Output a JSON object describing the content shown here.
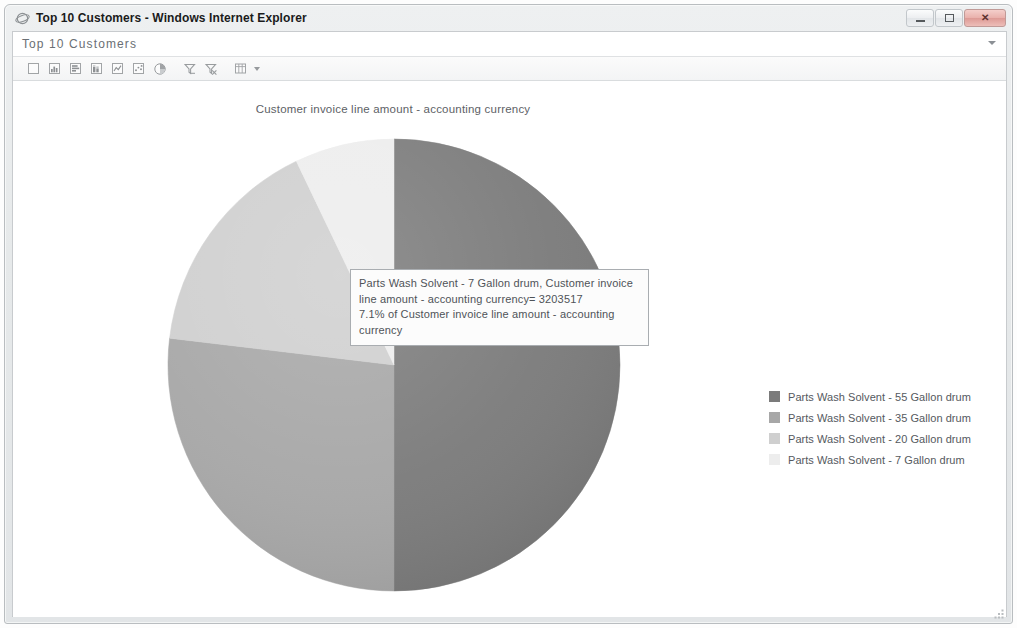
{
  "window": {
    "title": "Top 10 Customers - Windows Internet Explorer",
    "icon": "internet-explorer-icon",
    "minimize_label": "Minimize",
    "maximize_label": "Maximize",
    "close_label": "Close"
  },
  "page_header": {
    "title": "Top 10 Customers",
    "caret": "chevron-down-icon"
  },
  "toolbar": {
    "buttons": [
      {
        "name": "blank-report-icon",
        "tip": "Blank"
      },
      {
        "name": "column-chart-icon",
        "tip": "Column chart"
      },
      {
        "name": "bar-chart-icon",
        "tip": "Bar chart"
      },
      {
        "name": "stacked-chart-icon",
        "tip": "Stacked chart"
      },
      {
        "name": "line-chart-icon",
        "tip": "Line chart"
      },
      {
        "name": "scatter-chart-icon",
        "tip": "Scatter chart"
      },
      {
        "name": "pie-chart-icon",
        "tip": "Pie chart"
      },
      {
        "name": "filter-icon",
        "tip": "Filter"
      },
      {
        "name": "clear-filter-icon",
        "tip": "Clear filter"
      },
      {
        "name": "table-view-icon",
        "tip": "Table view"
      }
    ],
    "dropdown_caret": "chevron-down-icon"
  },
  "chart_data": {
    "type": "pie",
    "title": "Customer invoice line amount - accounting currency",
    "xlabel": "",
    "ylabel": "",
    "legend_position": "right",
    "grid": false,
    "categories": [
      "Parts Wash Solvent - 55 Gallon drum",
      "Parts Wash Solvent - 35 Gallon drum",
      "Parts Wash Solvent - 20 Gallon drum",
      "Parts Wash Solvent - 7 Gallon drum"
    ],
    "values": [
      50.0,
      26.9,
      16.0,
      7.1
    ],
    "value_unit": "percent",
    "colors": [
      "#7b7b7b",
      "#a7a7a7",
      "#cfcfcf",
      "#ededed"
    ],
    "slices": [
      {
        "label": "Parts Wash Solvent - 55 Gallon drum",
        "percent": 50.0,
        "color": "#7b7b7b",
        "start_angle": 0,
        "end_angle": 180
      },
      {
        "label": "Parts Wash Solvent - 35 Gallon drum",
        "percent": 26.9,
        "color": "#a7a7a7",
        "start_angle": 180,
        "end_angle": 276.8
      },
      {
        "label": "Parts Wash Solvent - 20 Gallon drum",
        "percent": 16.0,
        "color": "#cfcfcf",
        "start_angle": 276.8,
        "end_angle": 334.4
      },
      {
        "label": "Parts Wash Solvent - 7 Gallon drum",
        "percent": 7.1,
        "color": "#ededed",
        "start_angle": 334.4,
        "end_angle": 360
      }
    ]
  },
  "tooltip": {
    "line1": "Parts Wash Solvent - 7 Gallon drum, Customer invoice",
    "line2": "line amount - accounting currency= 3203517",
    "line3": "7.1% of Customer invoice line amount - accounting",
    "line4": "currency",
    "series": "Parts Wash Solvent - 7 Gallon drum",
    "measure": "Customer invoice line amount - accounting currency",
    "value": "3203517",
    "percent": "7.1%"
  },
  "legend": {
    "items": [
      {
        "label": "Parts Wash Solvent - 55 Gallon drum",
        "color": "#7b7b7b"
      },
      {
        "label": "Parts Wash Solvent - 35 Gallon drum",
        "color": "#a7a7a7"
      },
      {
        "label": "Parts Wash Solvent - 20 Gallon drum",
        "color": "#cfcfcf"
      },
      {
        "label": "Parts Wash Solvent - 7 Gallon drum",
        "color": "#ededed"
      }
    ]
  }
}
